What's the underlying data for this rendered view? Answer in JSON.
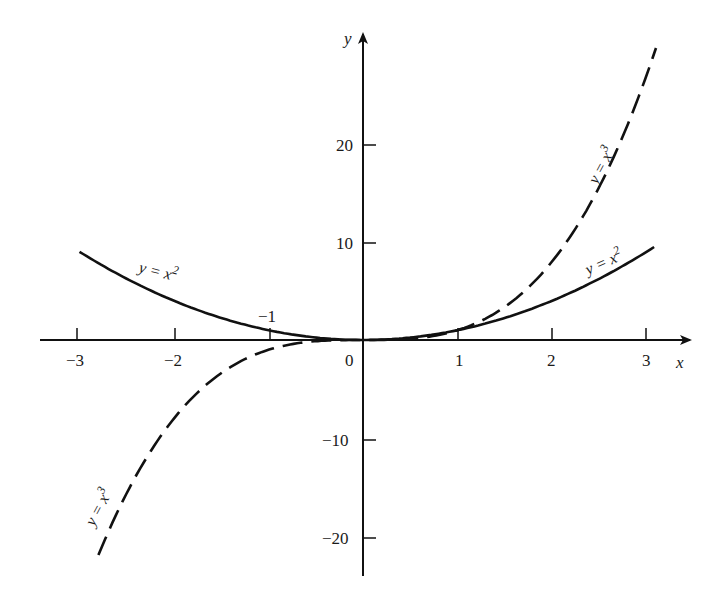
{
  "chart_data": {
    "type": "line",
    "title": "",
    "xlabel": "x",
    "ylabel": "y",
    "xlim": [
      -3.3,
      3.4
    ],
    "ylim": [
      -25,
      31
    ],
    "grid": false,
    "legend": "none (inline curve labels)",
    "x_ticks": [
      -3,
      -2,
      -1,
      1,
      2,
      3
    ],
    "x_tick_labels": [
      "−3",
      "−2",
      "−1",
      "1",
      "2",
      "3"
    ],
    "y_ticks": [
      20,
      10,
      -10,
      -20
    ],
    "y_tick_labels": [
      "20",
      "10",
      "−10",
      "−20"
    ],
    "origin_label": "0",
    "series": [
      {
        "name": "y = x^2",
        "style": "solid",
        "x": [
          -3,
          -2.5,
          -2,
          -1.5,
          -1,
          -0.5,
          0,
          0.5,
          1,
          1.5,
          2,
          2.5,
          3
        ],
        "values": [
          9,
          6.25,
          4,
          2.25,
          1,
          0.25,
          0,
          0.25,
          1,
          2.25,
          4,
          6.25,
          9
        ],
        "labels": [
          "y = x²",
          "y = x²"
        ]
      },
      {
        "name": "y = x^3",
        "style": "dashed",
        "x": [
          -2.8,
          -2.5,
          -2,
          -1.5,
          -1,
          -0.5,
          0,
          0.5,
          1,
          1.5,
          2,
          2.5,
          3,
          3.1
        ],
        "values": [
          -21.95,
          -15.63,
          -8,
          -3.38,
          -1,
          -0.13,
          0,
          0.13,
          1,
          3.38,
          8,
          15.63,
          27,
          29.79
        ],
        "labels": [
          "y = x³",
          "y = x³"
        ]
      }
    ]
  },
  "labels": {
    "x_axis": "x",
    "y_axis": "y",
    "origin": "0",
    "xticks": [
      "−3",
      "−2",
      "−1",
      "1",
      "2",
      "3"
    ],
    "yticks": [
      "20",
      "10",
      "−10",
      "−20"
    ],
    "sq_label_left": "y = x",
    "sq_label_right": "y = x",
    "cube_label_left": "y = x",
    "cube_label_right": "y = x",
    "sq_exp": "2",
    "cube_exp": "3"
  }
}
